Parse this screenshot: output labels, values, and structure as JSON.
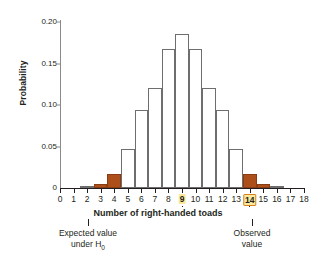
{
  "chart_data": {
    "type": "bar",
    "title": "",
    "subtitle": "",
    "xlabel": "Number of right-handed toads",
    "ylabel": "Probability",
    "categories": [
      0,
      1,
      2,
      3,
      4,
      5,
      6,
      7,
      8,
      9,
      10,
      11,
      12,
      13,
      14,
      15,
      16,
      17,
      18
    ],
    "values": [
      0.0,
      0.0,
      0.001,
      0.005,
      0.017,
      0.047,
      0.094,
      0.121,
      0.167,
      0.186,
      0.167,
      0.121,
      0.094,
      0.047,
      0.017,
      0.005,
      0.001,
      0.0,
      0.0
    ],
    "series": [
      {
        "name": "Binomial(18, 0.5) probability",
        "values": [
          0.0,
          0.0,
          0.001,
          0.005,
          0.017,
          0.047,
          0.094,
          0.121,
          0.167,
          0.186,
          0.167,
          0.121,
          0.094,
          0.047,
          0.017,
          0.005,
          0.001,
          0.0,
          0.0
        ]
      }
    ],
    "shaded_categories": [
      3,
      4,
      14,
      15
    ],
    "shaded_meaning": "two-tailed rejection region",
    "xlim": [
      0,
      18
    ],
    "ylim": [
      0,
      0.2
    ],
    "yticks": [
      "0",
      "0.05",
      "0.10",
      "0.15",
      "0.20"
    ],
    "ytick_values": [
      0,
      0.05,
      0.1,
      0.15,
      0.2
    ],
    "xticks": [
      "0",
      "1",
      "2",
      "3",
      "4",
      "5",
      "6",
      "7",
      "8",
      "9",
      "10",
      "11",
      "12",
      "13",
      "14",
      "15",
      "16",
      "17",
      "18"
    ],
    "grid": false,
    "legend": "none",
    "highlighted_xticks": [
      {
        "value": "9",
        "role": "expected-value"
      },
      {
        "value": "14",
        "role": "observed-value"
      }
    ],
    "annotations": [
      {
        "text": "Expected value",
        "text2": "under H",
        "subscript": "0",
        "points_to": "9"
      },
      {
        "text": "Observed",
        "text2": "value",
        "points_to": "14"
      }
    ],
    "colors": {
      "bar_fill": "#ffffff",
      "bar_edge": "#6e6e6e",
      "shaded_fill": "#ad4f1b",
      "shaded_edge": "#8a3c12",
      "highlight_bg": "#fbe89a",
      "highlight_border": "#d4811f",
      "axis": "#231f20",
      "text": "#231f20",
      "background": "#ffffff"
    }
  },
  "axis": {
    "ylabel": "Probability",
    "xlabel_caption": "Number of right-handed toads",
    "yticks": [
      {
        "label": "0.20"
      },
      {
        "label": "0.15"
      },
      {
        "label": "0.10"
      },
      {
        "label": "0.05"
      },
      {
        "label": "0"
      }
    ],
    "xticks": [
      {
        "label": "0"
      },
      {
        "label": "1"
      },
      {
        "label": "2"
      },
      {
        "label": "3"
      },
      {
        "label": "4"
      },
      {
        "label": "5"
      },
      {
        "label": "6"
      },
      {
        "label": "7"
      },
      {
        "label": "8"
      },
      {
        "label": "9"
      },
      {
        "label": "10"
      },
      {
        "label": "11"
      },
      {
        "label": "12"
      },
      {
        "label": "13"
      },
      {
        "label": "14"
      },
      {
        "label": "15"
      },
      {
        "label": "16"
      },
      {
        "label": "17"
      },
      {
        "label": "18"
      }
    ]
  },
  "notes": {
    "expected_line1": "Expected value",
    "expected_line2_pre": "under H",
    "expected_line2_sub": "0",
    "observed_line1": "Observed",
    "observed_line2": "value"
  }
}
